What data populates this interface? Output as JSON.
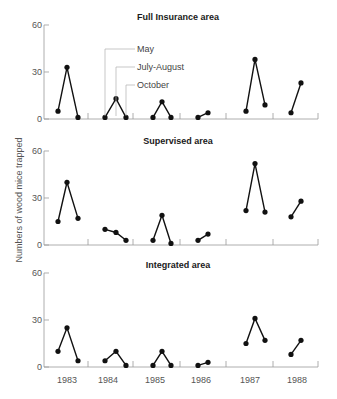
{
  "chart_data": {
    "type": "line",
    "ylabel": "Numbers of wood mice trapped",
    "xlabel": "",
    "years": [
      "1983",
      "1984",
      "1985",
      "1986",
      "1987",
      "1988"
    ],
    "months_legend": [
      "May",
      "July-August",
      "October"
    ],
    "yticks": [
      0,
      30,
      60
    ],
    "ylim": [
      0,
      60
    ],
    "grid": false,
    "panels": [
      {
        "title": "Full Insurance area",
        "series": [
          {
            "year": "1983",
            "values": [
              5,
              33,
              1
            ]
          },
          {
            "year": "1984",
            "values": [
              1,
              13,
              1
            ]
          },
          {
            "year": "1985",
            "values": [
              1,
              11,
              1
            ]
          },
          {
            "year": "1986",
            "values": [
              1,
              4
            ]
          },
          {
            "year": "1987",
            "values": [
              5,
              38,
              9
            ]
          },
          {
            "year": "1988",
            "values": [
              4,
              23
            ]
          }
        ]
      },
      {
        "title": "Supervised area",
        "series": [
          {
            "year": "1983",
            "values": [
              15,
              40,
              17
            ]
          },
          {
            "year": "1984",
            "values": [
              10,
              8,
              3
            ]
          },
          {
            "year": "1985",
            "values": [
              3,
              19,
              1
            ]
          },
          {
            "year": "1986",
            "values": [
              3,
              7
            ]
          },
          {
            "year": "1987",
            "values": [
              22,
              52,
              21
            ]
          },
          {
            "year": "1988",
            "values": [
              18,
              28
            ]
          }
        ]
      },
      {
        "title": "Integrated area",
        "series": [
          {
            "year": "1983",
            "values": [
              10,
              25,
              4
            ]
          },
          {
            "year": "1984",
            "values": [
              4,
              10,
              1
            ]
          },
          {
            "year": "1985",
            "values": [
              1,
              10,
              1
            ]
          },
          {
            "year": "1986",
            "values": [
              1,
              3
            ]
          },
          {
            "year": "1987",
            "values": [
              15,
              31,
              17
            ]
          },
          {
            "year": "1988",
            "values": [
              8,
              17
            ]
          }
        ]
      }
    ]
  },
  "layout": {
    "panel_zero_y": [
      119,
      245,
      367
    ],
    "px_per_unit": 1.5667,
    "axis_x": 44,
    "axis_end_x": 318,
    "year_separators": [
      88,
      133,
      180,
      226,
      273,
      318
    ],
    "year_label_x": [
      67,
      108,
      155,
      201,
      250,
      297
    ],
    "point_x": [
      [
        58,
        67,
        78
      ],
      [
        105,
        116,
        126
      ],
      [
        153,
        162,
        171
      ],
      [
        198,
        208
      ],
      [
        246,
        255,
        265
      ],
      [
        291,
        301
      ]
    ],
    "panel_title_x": 178,
    "panel_title_offset": [
      -99,
      -101,
      -99
    ]
  }
}
